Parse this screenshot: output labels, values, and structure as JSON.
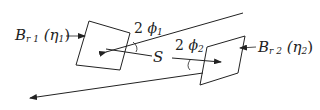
{
  "diagram": {
    "labels": {
      "br1_B": "B",
      "br1_sub": "r 1",
      "br1_eta": "(η",
      "br1_eta_sub": "1",
      "br1_close": ")",
      "br2_B": "B",
      "br2_sub": "r 2",
      "br2_eta": "(η",
      "br2_eta_sub": "2",
      "br2_close": ")",
      "angle1": "2",
      "phi1": "ϕ",
      "phi1_sub": "1",
      "angle2": "2",
      "phi2": "ϕ",
      "phi2_sub": "2",
      "separation": "S"
    },
    "stroke_color": "#222222"
  }
}
